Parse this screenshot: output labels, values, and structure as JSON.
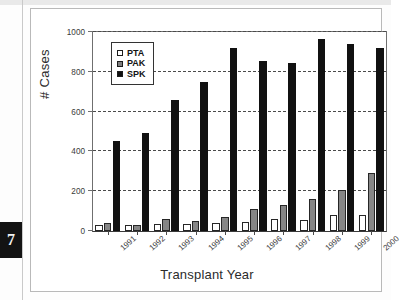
{
  "page": {
    "tab_number": "7"
  },
  "chart_data": {
    "type": "bar",
    "title": "",
    "xlabel": "Transplant Year",
    "ylabel": "# Cases",
    "ylim": [
      0,
      1000
    ],
    "yticks": [
      0,
      200,
      400,
      600,
      800,
      1000
    ],
    "ytick_labels": [
      "0",
      "200",
      "400",
      "600",
      "800",
      "1000"
    ],
    "grid": true,
    "grid_style": "dashed-horizontal",
    "legend_position": "top-left-inside",
    "categories": [
      "1991",
      "1992",
      "1993",
      "1994",
      "1995",
      "1996",
      "1997",
      "1998",
      "1999",
      "2000"
    ],
    "series": [
      {
        "name": "PTA",
        "color": "#ffffff",
        "edge_color": "#262626",
        "values": [
          32,
          28,
          36,
          33,
          38,
          46,
          62,
          55,
          80,
          80
        ]
      },
      {
        "name": "PAK",
        "color": "#868686",
        "edge_color": "#262626",
        "values": [
          38,
          30,
          62,
          52,
          68,
          110,
          130,
          160,
          208,
          290
        ]
      },
      {
        "name": "SPK",
        "color": "#111111",
        "edge_color": "#111111",
        "values": [
          452,
          492,
          658,
          748,
          920,
          855,
          845,
          965,
          940,
          920
        ]
      }
    ]
  }
}
